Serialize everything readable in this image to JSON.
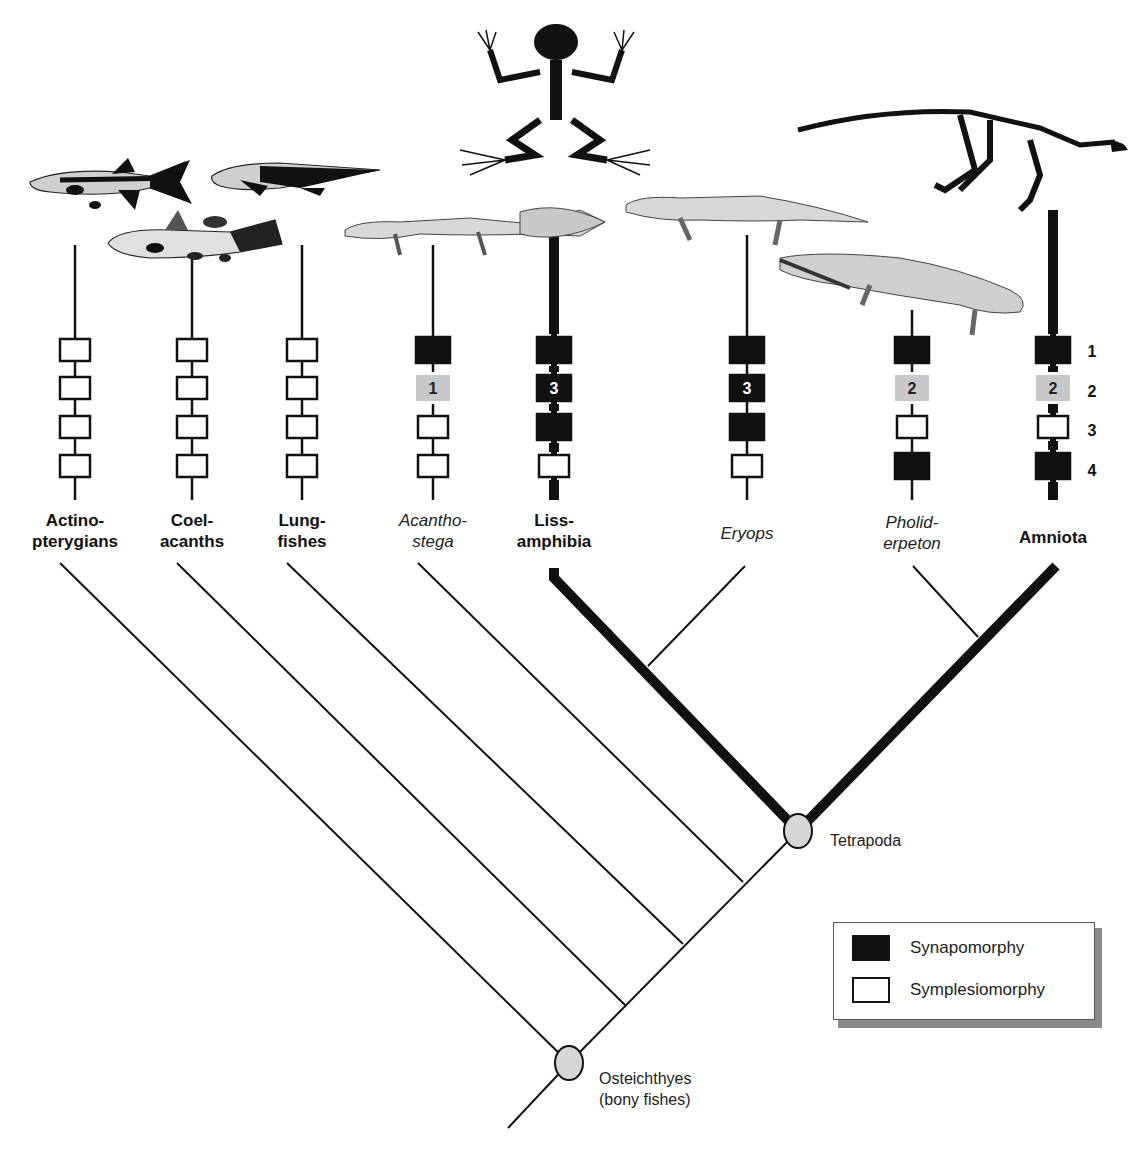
{
  "figure": {
    "colors": {
      "synapomorphy": "#111111",
      "symplesiomorphy": "#ffffff",
      "homoplasy_gray": "#c8c8c8",
      "node_fill": "#d6d6d6",
      "line": "#111111"
    }
  },
  "taxa": [
    {
      "id": "actinopterygians",
      "line1": "Actino-",
      "line2": "pterygians",
      "style": "bold",
      "x": 75,
      "thick": false,
      "illustration": "ray-finned-fish-icon"
    },
    {
      "id": "coelacanths",
      "line1": "Coel-",
      "line2": "acanths",
      "style": "bold",
      "x": 192,
      "thick": false,
      "illustration": "coelacanth-icon"
    },
    {
      "id": "lungfishes",
      "line1": "Lung-",
      "line2": "fishes",
      "style": "bold",
      "x": 302,
      "thick": false,
      "illustration": "lungfish-icon"
    },
    {
      "id": "acanthostega",
      "line1": "Acantho-",
      "line2": "stega",
      "style": "italic",
      "x": 433,
      "thick": false,
      "illustration": "acanthostega-skeleton-icon"
    },
    {
      "id": "lissamphibia",
      "line1": "Liss-",
      "line2": "amphibia",
      "style": "bold",
      "x": 554,
      "thick": true,
      "illustration": "frog-skeleton-icon"
    },
    {
      "id": "eryops",
      "line1": "Eryops",
      "line2": "",
      "style": "italic",
      "x": 747,
      "thick": false,
      "illustration": "eryops-skeleton-icon"
    },
    {
      "id": "pholiderpeton",
      "line1": "Pholid-",
      "line2": "erpeton",
      "style": "italic",
      "x": 912,
      "thick": false,
      "illustration": "pholiderpeton-skeleton-icon"
    },
    {
      "id": "amniota",
      "line1": "Amniota",
      "line2": "",
      "style": "bold",
      "x": 1053,
      "thick": true,
      "illustration": "dinosaur-skeleton-icon"
    }
  ],
  "characters": {
    "row_labels": [
      "1",
      "2",
      "3",
      "4"
    ],
    "matrix": [
      [
        {
          "state": "plesio"
        },
        {
          "state": "plesio"
        },
        {
          "state": "plesio"
        },
        {
          "state": "plesio"
        }
      ],
      [
        {
          "state": "plesio"
        },
        {
          "state": "plesio"
        },
        {
          "state": "plesio"
        },
        {
          "state": "plesio"
        }
      ],
      [
        {
          "state": "plesio"
        },
        {
          "state": "plesio"
        },
        {
          "state": "plesio"
        },
        {
          "state": "plesio"
        }
      ],
      [
        {
          "state": "apo"
        },
        {
          "state": "gray",
          "label": "1"
        },
        {
          "state": "plesio"
        },
        {
          "state": "plesio"
        }
      ],
      [
        {
          "state": "apo"
        },
        {
          "state": "apo",
          "label": "3"
        },
        {
          "state": "apo"
        },
        {
          "state": "plesio"
        }
      ],
      [
        {
          "state": "apo"
        },
        {
          "state": "apo",
          "label": "3"
        },
        {
          "state": "apo"
        },
        {
          "state": "plesio"
        }
      ],
      [
        {
          "state": "apo"
        },
        {
          "state": "gray",
          "label": "2"
        },
        {
          "state": "plesio"
        },
        {
          "state": "apo"
        }
      ],
      [
        {
          "state": "apo"
        },
        {
          "state": "gray",
          "label": "2"
        },
        {
          "state": "plesio"
        },
        {
          "state": "apo"
        }
      ]
    ]
  },
  "nodes": [
    {
      "id": "osteichthyes",
      "line1": "Osteichthyes",
      "line2": "(bony fishes)",
      "x": 569,
      "y": 1063
    },
    {
      "id": "tetrapoda",
      "line1": "Tetrapoda",
      "line2": "",
      "x": 798,
      "y": 831
    }
  ],
  "legend": {
    "items": [
      {
        "label": "Synapomorphy",
        "swatch": "filled"
      },
      {
        "label": "Symplesiomorphy",
        "swatch": "open"
      }
    ]
  }
}
